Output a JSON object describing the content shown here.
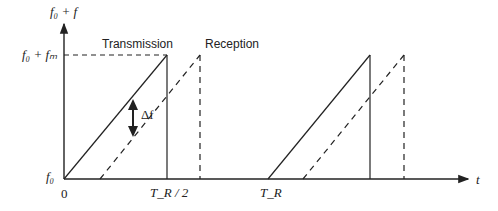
{
  "diagram": {
    "y_axis_label": "f₀ + f",
    "top_level_label": "f₀ + fₘ",
    "baseline_label": "f₀",
    "origin_label": "0",
    "tick_half_period": "T_R / 2",
    "tick_period": "T_R",
    "x_axis_label": "t",
    "transmission_label": "Transmission",
    "reception_label": "Reception",
    "delta_label": "Δf"
  }
}
